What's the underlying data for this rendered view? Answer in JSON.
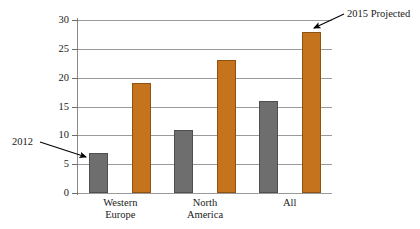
{
  "chart_data": {
    "type": "bar",
    "title": "",
    "subtitle": "",
    "xlabel": "",
    "ylabel": "",
    "ylim": [
      0,
      30
    ],
    "ytick_values": [
      0,
      5,
      10,
      15,
      20,
      25,
      30
    ],
    "ytick_labels": [
      "0",
      "5",
      "10",
      "15",
      "20",
      "25",
      "30"
    ],
    "grid": "horizontal",
    "legend_position": "none",
    "categories": [
      "Western Europe",
      "North America",
      "All"
    ],
    "category_label_lines": [
      [
        "Western",
        "Europe"
      ],
      [
        "North",
        "America"
      ],
      [
        "All"
      ]
    ],
    "series": [
      {
        "name": "2012",
        "color": "#6e6e6e",
        "values": [
          7,
          11,
          16
        ]
      },
      {
        "name": "2015 Projected",
        "color": "#c5731c",
        "values": [
          19,
          23,
          28
        ]
      }
    ],
    "annotations": [
      {
        "id": "annot-2012",
        "text": "2012",
        "points_to_series": "2012",
        "points_to_category": "Western Europe",
        "points_to_value": 7
      },
      {
        "id": "annot-2015-projected",
        "text": "2015 Projected",
        "points_to_series": "2015 Projected",
        "points_to_category": "All",
        "points_to_value": 28
      }
    ],
    "colors": {
      "series_2012": "#6e6e6e",
      "series_2015_projected": "#c5731c",
      "gridline": "#9a9a9a",
      "axis": "#8a8a8a",
      "text": "#1a1a1a",
      "background": "#ffffff"
    }
  }
}
